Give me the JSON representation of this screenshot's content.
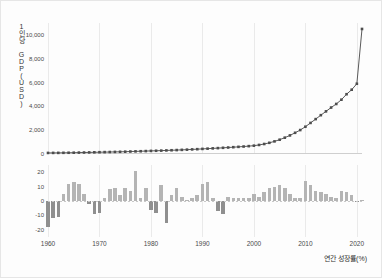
{
  "figure": {
    "background_color": "#fdfdfd",
    "border_color": "#e6e6e6",
    "line_color": "#5a5a5a",
    "marker_color": "#4d4d4d",
    "bar_color_positive": "#b4b4b4",
    "bar_color_negative": "#8f8f8f",
    "grid_color": "#eaeaea"
  },
  "top_panel": {
    "ylabel": "1인당 GDP(USD)",
    "ylabel_chars": [
      "일",
      "인",
      "당",
      "G",
      "D",
      "P",
      "(",
      "U",
      "S",
      "D",
      ")"
    ],
    "yticks": [
      "0",
      "2,000",
      "4,000",
      "6,000",
      "8,000",
      "10,000"
    ]
  },
  "bottom_panel": {
    "xlabel": "연간 성장률(%)",
    "yticks": [
      "20",
      "10",
      "0",
      "-10",
      "-20"
    ]
  },
  "xaxis": {
    "ticks": [
      "1960",
      "1970",
      "1980",
      "1990",
      "2000",
      "2010",
      "2020"
    ]
  },
  "chart_data": [
    {
      "type": "line",
      "title": "",
      "subtitle": "",
      "xlabel": "",
      "ylabel": "1인당 GDP(USD)",
      "ylim": [
        0,
        11000
      ],
      "xlim": [
        1960,
        2021
      ],
      "yticks": [
        0,
        2000,
        4000,
        6000,
        8000,
        10000
      ],
      "ytick_labels": [
        "0",
        "2,000",
        "4,000",
        "6,000",
        "8,000",
        "10,000"
      ],
      "xticks": [
        1960,
        1970,
        1980,
        1990,
        2000,
        2010,
        2020
      ],
      "grid": "vertical",
      "legend": "none",
      "marker": "square",
      "series": [
        {
          "name": "1인당 GDP(USD)",
          "x": [
            1960,
            1961,
            1962,
            1963,
            1964,
            1965,
            1966,
            1967,
            1968,
            1969,
            1970,
            1971,
            1972,
            1973,
            1974,
            1975,
            1976,
            1977,
            1978,
            1979,
            1980,
            1981,
            1982,
            1983,
            1984,
            1985,
            1986,
            1987,
            1988,
            1989,
            1990,
            1991,
            1992,
            1993,
            1994,
            1995,
            1996,
            1997,
            1998,
            1999,
            2000,
            2001,
            2002,
            2003,
            2004,
            2005,
            2006,
            2007,
            2008,
            2009,
            2010,
            2011,
            2012,
            2013,
            2014,
            2015,
            2016,
            2017,
            2018,
            2019,
            2020,
            2021
          ],
          "values": [
            90,
            92,
            95,
            100,
            105,
            110,
            118,
            125,
            133,
            142,
            150,
            158,
            165,
            175,
            185,
            195,
            208,
            220,
            232,
            245,
            260,
            272,
            285,
            300,
            315,
            330,
            348,
            365,
            385,
            405,
            428,
            450,
            472,
            495,
            520,
            545,
            572,
            600,
            628,
            660,
            700,
            760,
            840,
            940,
            1060,
            1200,
            1370,
            1560,
            1780,
            2010,
            2290,
            2610,
            2930,
            3260,
            3580,
            3900,
            4200,
            4560,
            5020,
            5400,
            5900,
            10500
          ]
        }
      ]
    },
    {
      "type": "bar",
      "title": "",
      "xlabel": "연간 성장률(%)",
      "ylabel": "",
      "ylim": [
        -25,
        25
      ],
      "xlim": [
        1960,
        2021
      ],
      "yticks": [
        -20,
        -10,
        0,
        10,
        20
      ],
      "ytick_labels": [
        "-20",
        "-10",
        "0",
        "10",
        "20"
      ],
      "xticks": [
        1960,
        1970,
        1980,
        1990,
        2000,
        2010,
        2020
      ],
      "grid": "vertical",
      "legend": "none",
      "categories": [
        1960,
        1961,
        1962,
        1963,
        1964,
        1965,
        1966,
        1967,
        1968,
        1969,
        1970,
        1971,
        1972,
        1973,
        1974,
        1975,
        1976,
        1977,
        1978,
        1979,
        1980,
        1981,
        1982,
        1983,
        1984,
        1985,
        1986,
        1987,
        1988,
        1989,
        1990,
        1991,
        1992,
        1993,
        1994,
        1995,
        1996,
        1997,
        1998,
        1999,
        2000,
        2001,
        2002,
        2003,
        2004,
        2005,
        2006,
        2007,
        2008,
        2009,
        2010,
        2011,
        2012,
        2013,
        2014,
        2015,
        2016,
        2017,
        2018,
        2019,
        2020,
        2021
      ],
      "values": [
        -18,
        -12,
        -11,
        5,
        12,
        13,
        12,
        5,
        -2,
        -9,
        -8,
        2,
        8,
        9,
        4,
        9,
        7,
        21,
        2,
        9,
        -6,
        -8,
        11,
        -15,
        4,
        9,
        3,
        1,
        2,
        4,
        12,
        13,
        2,
        -7,
        -9,
        3,
        2,
        2,
        2,
        2,
        5,
        3,
        6,
        9,
        10,
        11,
        9,
        5,
        2,
        2,
        14,
        11,
        7,
        6,
        5,
        3,
        2,
        7,
        6,
        4,
        -1,
        1
      ]
    }
  ]
}
